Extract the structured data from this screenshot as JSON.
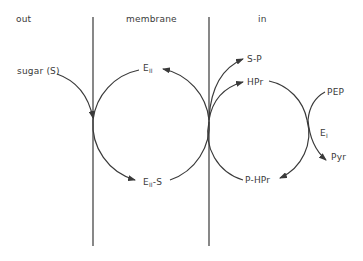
{
  "regions": {
    "out": "out",
    "membrane": "membrane",
    "in": "in"
  },
  "labels": {
    "sugar": "sugar (S)",
    "e2": {
      "base": "E",
      "sub": "II"
    },
    "e2s": {
      "base": "E",
      "sub": "II",
      "suffix": "-S"
    },
    "sp": "S-P",
    "hpr": "HPr",
    "phpr": "P-HPr",
    "pep": "PEP",
    "e1": {
      "base": "E",
      "sub": "I"
    },
    "pyr": "Pyr"
  },
  "colors": {
    "line": "#3a3a3a",
    "text": "#3a3a3a",
    "background": "#ffffff"
  }
}
